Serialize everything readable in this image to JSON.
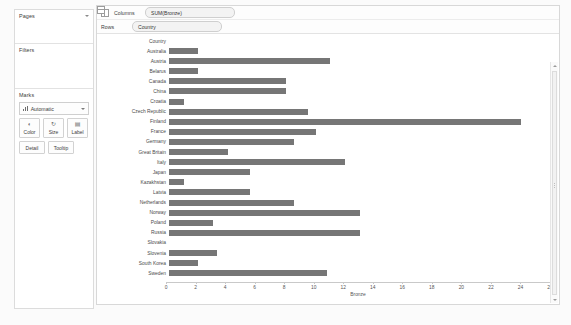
{
  "left_panel": {
    "pages": {
      "title": "Pages",
      "collapse_icon": "chevron-down-icon"
    },
    "filters": {
      "title": "Filters"
    },
    "marks": {
      "title": "Marks",
      "mark_type": "Automatic",
      "buttons": [
        {
          "label": "Color",
          "icon": "color-palette-icon"
        },
        {
          "label": "Size",
          "icon": "size-icon"
        },
        {
          "label": "Label",
          "icon": "label-icon"
        }
      ],
      "secondary_buttons": [
        {
          "label": "Detail"
        },
        {
          "label": "Tooltip"
        }
      ]
    }
  },
  "shelves": [
    {
      "name": "Columns",
      "icon": "columns-icon",
      "pill": "SUM(Bronze)"
    },
    {
      "name": "Rows",
      "icon": "rows-icon",
      "pill": "Country"
    }
  ],
  "chart_data": {
    "type": "bar",
    "orientation": "horizontal",
    "title": "",
    "row_header": "Country",
    "xlabel": "Bronze",
    "ylabel": "Country",
    "xlim": [
      0,
      26
    ],
    "xticks": [
      0,
      2,
      4,
      6,
      8,
      10,
      12,
      14,
      16,
      18,
      20,
      22,
      24,
      26
    ],
    "grid": false,
    "legend": "none",
    "bar_color": "#767676",
    "categories": [
      "Australia",
      "Austria",
      "Belarus",
      "Canada",
      "China",
      "Croatia",
      "Czech Republic",
      "Finland",
      "France",
      "Germany",
      "Great Britain",
      "Italy",
      "Japan",
      "Kazakhstan",
      "Latvia",
      "Netherlands",
      "Norway",
      "Poland",
      "Russia",
      "Slovakia",
      "Slovenia",
      "South Korea",
      "Sweden"
    ],
    "values": [
      2,
      11,
      2,
      8,
      8,
      1,
      9.5,
      24,
      10,
      8.5,
      4,
      12,
      5.5,
      1,
      5.5,
      8.5,
      13,
      3,
      13,
      0,
      3.3,
      2,
      10.8
    ]
  },
  "scrollbar": {
    "up_icon": "chevron-up-icon",
    "down_icon": "chevron-down-icon",
    "grip_icon": "grip-icon"
  }
}
